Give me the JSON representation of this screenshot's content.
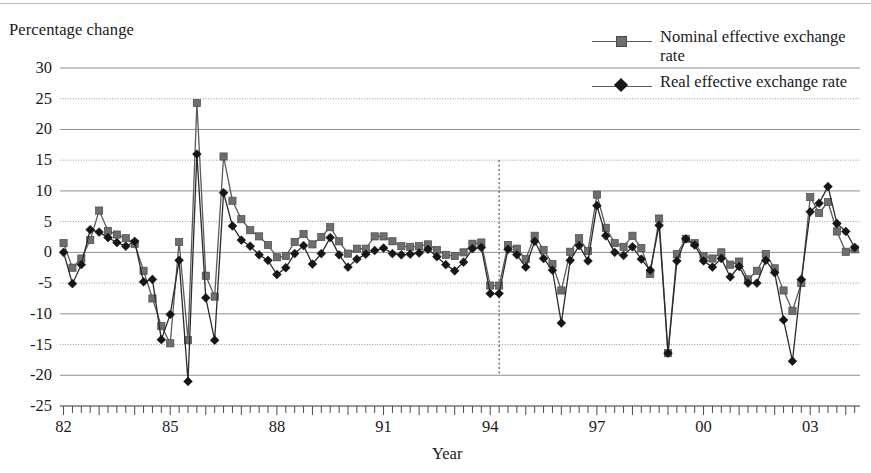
{
  "axes": {
    "y_title": "Percentage change",
    "x_title": "Year",
    "y_ticks": [
      30,
      25,
      20,
      15,
      10,
      5,
      0,
      -5,
      -10,
      -15,
      -20,
      -25
    ],
    "y_tick_labels": [
      "30",
      "25",
      "20",
      "15",
      "10",
      "5",
      "0",
      "-5",
      "-10",
      "-15",
      "-20",
      "-25"
    ],
    "x_tick_labels": [
      "82",
      "85",
      "88",
      "91",
      "94",
      "97",
      "00",
      "03"
    ],
    "x_tick_years": [
      1982,
      1985,
      1988,
      1991,
      1994,
      1997,
      2000,
      2003
    ]
  },
  "legend": {
    "items": [
      {
        "label": "Nominal effective exchange rate",
        "marker": "square",
        "color": "#6e6e6e"
      },
      {
        "label": "Real effective exchange rate",
        "marker": "diamond",
        "color": "#161616"
      }
    ]
  },
  "annotations": {
    "vertical_marker": {
      "x_year": 1994.25,
      "y_top": 15,
      "y_bottom": -20,
      "style": "dotted"
    }
  },
  "colors": {
    "nominal": "#6e6e6e",
    "nominal_line": "#5b5b5b",
    "real": "#161616",
    "real_line": "#2b2b2b",
    "gridline_solid": "#8f8f8f",
    "gridline_dotted": "#9a9a9a",
    "axis": "#4a4a4a",
    "background": "#ffffff"
  },
  "chart_data": {
    "type": "line",
    "title": "",
    "xlabel": "Year",
    "ylabel": "Percentage change",
    "xlim": [
      1981.9,
      2004.4
    ],
    "ylim": [
      -25,
      30
    ],
    "grid": true,
    "legend_position": "top-right",
    "x_unit": "quarter",
    "x": [
      1982.0,
      1982.25,
      1982.5,
      1982.75,
      1983.0,
      1983.25,
      1983.5,
      1983.75,
      1984.0,
      1984.25,
      1984.5,
      1984.75,
      1985.0,
      1985.25,
      1985.5,
      1985.75,
      1986.0,
      1986.25,
      1986.5,
      1986.75,
      1987.0,
      1987.25,
      1987.5,
      1987.75,
      1988.0,
      1988.25,
      1988.5,
      1988.75,
      1989.0,
      1989.25,
      1989.5,
      1989.75,
      1990.0,
      1990.25,
      1990.5,
      1990.75,
      1991.0,
      1991.25,
      1991.5,
      1991.75,
      1992.0,
      1992.25,
      1992.5,
      1992.75,
      1993.0,
      1993.25,
      1993.5,
      1993.75,
      1994.0,
      1994.25,
      1994.5,
      1994.75,
      1995.0,
      1995.25,
      1995.5,
      1995.75,
      1996.0,
      1996.25,
      1996.5,
      1996.75,
      1997.0,
      1997.25,
      1997.5,
      1997.75,
      1998.0,
      1998.25,
      1998.5,
      1998.75,
      1999.0,
      1999.25,
      1999.5,
      1999.75,
      2000.0,
      2000.25,
      2000.5,
      2000.75,
      2001.0,
      2001.25,
      2001.5,
      2001.75,
      2002.0,
      2002.25,
      2002.5,
      2002.75,
      2003.0,
      2003.25,
      2003.5,
      2003.75,
      2004.0,
      2004.25
    ],
    "series": [
      {
        "name": "Nominal effective exchange rate",
        "marker": "square",
        "color": "#6e6e6e",
        "values": [
          1.5,
          -2.5,
          -1.0,
          2.0,
          6.8,
          3.5,
          2.9,
          2.3,
          1.4,
          -3.0,
          -7.5,
          -12.0,
          -14.8,
          1.7,
          -14.3,
          24.3,
          -3.8,
          -7.2,
          15.6,
          8.4,
          5.4,
          3.6,
          2.6,
          1.2,
          -0.8,
          -0.6,
          1.7,
          3.0,
          1.3,
          2.5,
          4.1,
          1.8,
          -0.2,
          0.6,
          0.6,
          2.6,
          2.6,
          1.8,
          1.0,
          0.9,
          1.0,
          1.3,
          0.4,
          -0.4,
          -0.6,
          0.0,
          1.4,
          1.6,
          -5.4,
          -5.4,
          1.2,
          0.6,
          -1.1,
          2.7,
          0.4,
          -1.9,
          -6.2,
          0.1,
          2.3,
          0.2,
          9.4,
          4.0,
          1.5,
          0.9,
          2.7,
          0.7,
          -3.5,
          5.5,
          -16.4,
          -0.3,
          2.2,
          1.5,
          -0.6,
          -1.0,
          0.0,
          -2.0,
          -1.5,
          -4.4,
          -3.0,
          -0.3,
          -2.6,
          -6.2,
          -9.5,
          -5.0,
          9.0,
          6.4,
          8.2,
          3.4,
          0.1,
          0.5
        ]
      },
      {
        "name": "Real effective exchange rate",
        "marker": "diamond",
        "color": "#161616",
        "values": [
          0.0,
          -5.1,
          -2.0,
          3.7,
          3.3,
          2.4,
          1.6,
          1.0,
          1.8,
          -4.8,
          -4.4,
          -14.2,
          -10.1,
          -1.3,
          -21.0,
          16.0,
          -7.4,
          -14.3,
          9.7,
          4.3,
          2.0,
          1.0,
          -0.4,
          -1.3,
          -3.6,
          -2.5,
          -0.2,
          1.1,
          -1.9,
          -0.2,
          2.4,
          -0.4,
          -2.4,
          -1.1,
          -0.3,
          0.3,
          0.7,
          -0.2,
          -0.4,
          -0.3,
          -0.1,
          0.5,
          -0.7,
          -2.0,
          -3.0,
          -1.6,
          0.6,
          0.8,
          -6.7,
          -6.7,
          0.5,
          -0.4,
          -2.4,
          1.8,
          -1.0,
          -2.9,
          -11.5,
          -1.3,
          1.1,
          -1.4,
          7.6,
          2.7,
          0.0,
          -0.5,
          0.9,
          -1.1,
          -2.9,
          4.4,
          -16.4,
          -1.4,
          2.2,
          1.2,
          -1.4,
          -2.4,
          -1.0,
          -4.0,
          -2.3,
          -5.0,
          -5.0,
          -1.3,
          -3.3,
          -11.0,
          -17.7,
          -4.4,
          6.6,
          8.0,
          10.7,
          4.7,
          3.4,
          0.8
        ]
      }
    ]
  }
}
